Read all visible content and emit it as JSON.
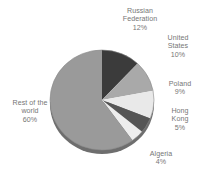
{
  "chart_data": {
    "type": "pie",
    "title": "",
    "subtitle": "",
    "xlabel": "",
    "ylabel": "",
    "legend_position": "none",
    "grid": false,
    "three_d": true,
    "units": "percent",
    "categories": [
      "Russian Federation",
      "United States",
      "Poland",
      "Hong Kong",
      "Algeria",
      "Rest of the world"
    ],
    "values": [
      12,
      10,
      9,
      5,
      4,
      60
    ],
    "slices": [
      {
        "name": "Russian Federation",
        "label_line1": "Russian",
        "label_line2": "Federation",
        "value": 12,
        "value_label": "12%",
        "color": "#3b3b3b"
      },
      {
        "name": "United States",
        "label_line1": "United",
        "label_line2": "States",
        "value": 10,
        "value_label": "10%",
        "color": "#a9a9a9"
      },
      {
        "name": "Poland",
        "label_line1": "Poland",
        "label_line2": "",
        "value": 9,
        "value_label": "9%",
        "color": "#e9e9e9"
      },
      {
        "name": "Hong Kong",
        "label_line1": "Hong",
        "label_line2": "Kong",
        "value": 5,
        "value_label": "5%",
        "color": "#555555"
      },
      {
        "name": "Algeria",
        "label_line1": "Algeria",
        "label_line2": "",
        "value": 4,
        "value_label": "4%",
        "color": "#ededed"
      },
      {
        "name": "Rest of the world",
        "label_line1": "Rest of the",
        "label_line2": "world",
        "value": 60,
        "value_label": "60%",
        "color": "#9a9a9a"
      }
    ],
    "colors": {
      "background": "#ffffff",
      "label_text": "#767676",
      "pie_depth_shadow": "#6e6e6e",
      "outline": "#8a8a8a"
    }
  }
}
